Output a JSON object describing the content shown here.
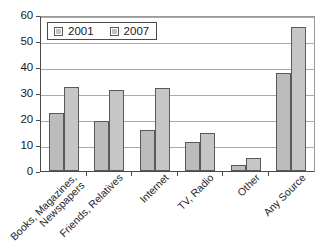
{
  "chart_data": {
    "type": "bar",
    "title": "",
    "subtitle": "",
    "xlabel": "",
    "ylabel": "",
    "ylim": [
      0,
      60
    ],
    "ytick_step": 10,
    "yticks": [
      "60",
      "50",
      "40",
      "30",
      "20",
      "10",
      "0"
    ],
    "grid": true,
    "legend_position": "top-left-inside",
    "categories": [
      "Books, Magazines, Newspapers",
      "Friends, Relatives",
      "Internet",
      "TV, Radio",
      "Other",
      "Any Source"
    ],
    "category_lines": [
      [
        "Books, Magazines,",
        "Newspapers"
      ],
      [
        "Friends, Relatives"
      ],
      [
        "Internet"
      ],
      [
        "TV, Radio"
      ],
      [
        "Other"
      ],
      [
        "Any Source"
      ]
    ],
    "series": [
      {
        "name": "2001",
        "color": "#bcbcbc",
        "values": [
          22.5,
          19.2,
          15.6,
          11.1,
          2.2,
          37.7
        ]
      },
      {
        "name": "2007",
        "color": "#c6c6c6",
        "values": [
          32.5,
          31.0,
          32.0,
          14.7,
          5.0,
          55.3
        ]
      }
    ]
  },
  "legend": {
    "items": [
      {
        "label": "2001"
      },
      {
        "label": "2007"
      }
    ]
  },
  "colors": {
    "bar_fill_2001": "#bcbcbc",
    "bar_fill_2007": "#c6c6c6",
    "bar_border": "#5a5a5a",
    "axis": "#4a4a4a",
    "grid": "#a9a9a9",
    "text": "#1a1a1a",
    "background": "#ffffff"
  }
}
